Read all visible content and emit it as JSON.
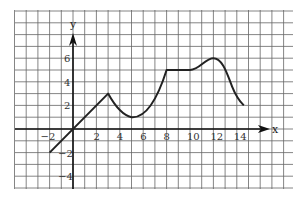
{
  "chart_data": {
    "type": "line",
    "title": "",
    "xlabel": "x",
    "ylabel": "y",
    "xlim": [
      -5,
      19
    ],
    "ylim": [
      -5,
      10
    ],
    "grid": true,
    "x_ticks": [
      "-2",
      "2",
      "4",
      "6",
      "8",
      "10",
      "12",
      "14"
    ],
    "y_ticks": [
      "6",
      "4",
      "2",
      "-2",
      "-4"
    ],
    "series": [
      {
        "name": "f(x)",
        "points": [
          [
            -2,
            -2
          ],
          [
            3,
            3
          ],
          [
            4,
            1.6
          ],
          [
            5,
            1
          ],
          [
            6,
            1.5
          ],
          [
            7,
            3
          ],
          [
            8,
            5
          ],
          [
            10,
            5
          ],
          [
            11,
            5.5
          ],
          [
            12,
            6
          ],
          [
            13,
            4.5
          ],
          [
            14,
            2.8
          ],
          [
            14.5,
            2
          ]
        ]
      }
    ]
  },
  "axes": {
    "x_label": "x",
    "y_label": "y"
  },
  "colors": {
    "grid": "#555555",
    "curve": "#222222",
    "background": "#ffffff"
  }
}
